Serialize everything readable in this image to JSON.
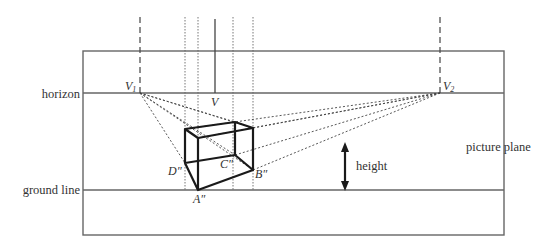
{
  "diagram": {
    "labels": {
      "horizon": "horizon",
      "ground_line": "ground line",
      "picture_plane": "picture plane",
      "height": "height",
      "v1": "V",
      "v1_sub": "1",
      "v2": "V",
      "v2_sub": "2",
      "v": "V",
      "a": "A″",
      "b": "B″",
      "c": "C″",
      "d": "D″"
    },
    "colors": {
      "frame": "#555555",
      "box": "#1a1a1a",
      "construction": "#555555",
      "text": "#333333"
    },
    "geometry": {
      "frame": {
        "x1": 83,
        "y1": 51,
        "x2": 504,
        "y2": 235
      },
      "horizon_y": 93,
      "ground_y": 190,
      "vanishing_points": {
        "V1": [
          140,
          93
        ],
        "V2": [
          440,
          93
        ]
      },
      "center_line_x": 215,
      "projection_lines_x": [
        185,
        198,
        233,
        253
      ],
      "box_vertices": {
        "A": [
          198,
          190
        ],
        "B": [
          253,
          170
        ],
        "C": [
          235,
          155
        ],
        "D": [
          185,
          163
        ],
        "A_top": [
          198,
          138
        ],
        "B_top": [
          253,
          128
        ],
        "C_top": [
          235,
          122
        ],
        "D_top": [
          185,
          129
        ]
      },
      "height_arrow": {
        "x": 345,
        "y_top": 143,
        "y_bottom": 190
      }
    }
  }
}
